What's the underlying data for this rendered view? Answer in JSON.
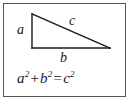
{
  "figure": {
    "type": "right-triangle-diagram",
    "background_color": "#ffffff",
    "border_color": "#555555",
    "stroke_color": "#1a1a1a",
    "labels": {
      "vertical_leg": "a",
      "horizontal_leg": "b",
      "hypotenuse": "c"
    },
    "equation": {
      "term1_base": "a",
      "term1_exp": "2",
      "plus": "+",
      "term2_base": "b",
      "term2_exp": "2",
      "equals": "=",
      "term3_base": "c",
      "term3_exp": "2",
      "plain_text": "a² + b² = c²"
    },
    "geometry": {
      "apex": "32,14",
      "right_angle_vertex": "32,48",
      "base_end": "110,48"
    }
  }
}
